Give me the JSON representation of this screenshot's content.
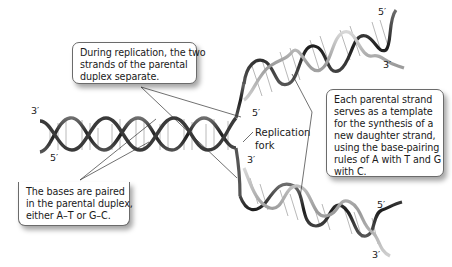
{
  "diagram": {
    "type": "DNA replication fork",
    "colors": {
      "strand_dark": "#2b2b2b",
      "strand_mid": "#7a7a7a",
      "strand_light": "#bdbdbd",
      "rungs": "#9a9a9a",
      "leader_lines": "#333333",
      "callout_border": "#6b6b6b"
    },
    "callouts": {
      "separation": {
        "lines": [
          "During replication, the two",
          "strands of the parental",
          "duplex separate."
        ]
      },
      "pairing": {
        "lines": [
          "The bases are paired",
          "in the parental duplex,",
          "either A–T or G–C."
        ]
      },
      "template": {
        "lines": [
          "Each parental strand",
          "serves as a template",
          "for the synthesis of a",
          "new daughter strand,",
          "using the base-pairing",
          "rules of A with T and G",
          "with C."
        ]
      }
    },
    "fork_label": {
      "lines": [
        "Replication",
        "fork"
      ]
    },
    "end_labels": {
      "parent_left_top": "3′",
      "parent_left_bottom": "5′",
      "upper_branch_top": "5′",
      "upper_branch_bottom": "3′",
      "fork_upper": "5′",
      "fork_lower": "3′",
      "lower_branch_top": "5′",
      "lower_branch_bottom": "3′"
    }
  }
}
